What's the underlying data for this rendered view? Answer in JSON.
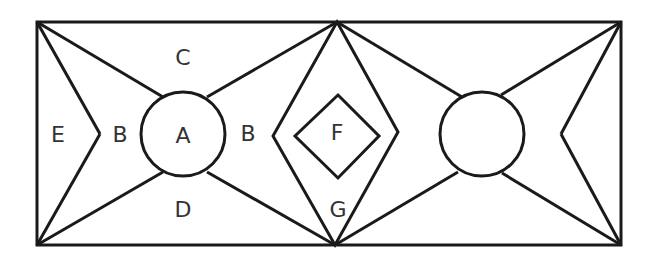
{
  "diagram": {
    "labels": {
      "A": "A",
      "B_left": "B",
      "B_right": "B",
      "C": "C",
      "D": "D",
      "E": "E",
      "F": "F",
      "G": "G"
    },
    "colors": {
      "stroke": "#1a1a1a",
      "background": "#ffffff",
      "text": "#333333"
    }
  }
}
